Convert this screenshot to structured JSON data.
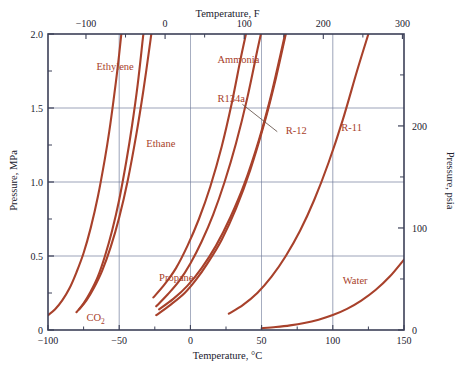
{
  "chart_data": {
    "type": "line",
    "title": "",
    "xlabel": "Temperature, °C",
    "xlabel_top": "Temperature, F",
    "ylabel": "Pressure, MPa",
    "ylabel_right": "Pressure, psia",
    "xlim": [
      -100,
      150
    ],
    "ylim": [
      0,
      2.0
    ],
    "xlim_top_F": [
      -148,
      302
    ],
    "ylim_right_psia": [
      0,
      290.1
    ],
    "grid": true,
    "legend_position": "inline-annotations",
    "xticks_bottom": [
      {
        "value": -100,
        "label": "−100"
      },
      {
        "value": -50,
        "label": "−50"
      },
      {
        "value": 0,
        "label": "0"
      },
      {
        "value": 50,
        "label": "50"
      },
      {
        "value": 100,
        "label": "100"
      },
      {
        "value": 150,
        "label": "150"
      }
    ],
    "xticks_top_F": [
      {
        "value": -100,
        "label": "−100"
      },
      {
        "value": 0,
        "label": "0"
      },
      {
        "value": 100,
        "label": "100"
      },
      {
        "value": 200,
        "label": "200"
      },
      {
        "value": 300,
        "label": "300"
      }
    ],
    "yticks_left": [
      {
        "value": 0,
        "label": "0",
        "major": true
      },
      {
        "value": 0.25,
        "label": "",
        "major": false
      },
      {
        "value": 0.5,
        "label": "0.5",
        "major": true
      },
      {
        "value": 0.75,
        "label": "",
        "major": false
      },
      {
        "value": 1.0,
        "label": "1.0",
        "major": true
      },
      {
        "value": 1.25,
        "label": "",
        "major": false
      },
      {
        "value": 1.5,
        "label": "1.5",
        "major": true
      },
      {
        "value": 1.75,
        "label": "",
        "major": false
      },
      {
        "value": 2.0,
        "label": "2.0",
        "major": true
      }
    ],
    "yticks_right_psia": [
      {
        "value": 0,
        "label": "0",
        "major": true
      },
      {
        "value": 50,
        "label": "",
        "major": false
      },
      {
        "value": 100,
        "label": "100",
        "major": true
      },
      {
        "value": 150,
        "label": "",
        "major": false
      },
      {
        "value": 200,
        "label": "200",
        "major": true
      },
      {
        "value": 250,
        "label": "",
        "major": false
      },
      {
        "value": 300,
        "label": "300",
        "major": true
      }
    ],
    "curve_color": "#A8412B",
    "frame_color": "#3c4058",
    "grid_color": "#6e7a99",
    "series": [
      {
        "name": "CO2",
        "label": "CO₂",
        "points": [
          [
            -100,
            0.1
          ],
          [
            -95,
            0.14
          ],
          [
            -90,
            0.2
          ],
          [
            -85,
            0.28
          ],
          [
            -80,
            0.39
          ],
          [
            -75,
            0.52
          ],
          [
            -70,
            0.69
          ],
          [
            -65,
            0.9
          ],
          [
            -60,
            1.16
          ],
          [
            -57,
            1.34
          ],
          [
            -54,
            1.55
          ],
          [
            -51,
            1.78
          ],
          [
            -48.5,
            2.0
          ]
        ]
      },
      {
        "name": "Ethylene",
        "label": "Ethylene",
        "points": [
          [
            -80,
            0.12
          ],
          [
            -75,
            0.18
          ],
          [
            -70,
            0.26
          ],
          [
            -65,
            0.36
          ],
          [
            -60,
            0.5
          ],
          [
            -55,
            0.67
          ],
          [
            -50,
            0.88
          ],
          [
            -45,
            1.14
          ],
          [
            -41,
            1.38
          ],
          [
            -37,
            1.66
          ],
          [
            -33.5,
            1.96
          ],
          [
            -33,
            2.0
          ]
        ]
      },
      {
        "name": "Ethane",
        "label": "Ethane",
        "points": [
          [
            -78,
            0.14
          ],
          [
            -73,
            0.2
          ],
          [
            -68,
            0.28
          ],
          [
            -62,
            0.4
          ],
          [
            -56,
            0.56
          ],
          [
            -50,
            0.76
          ],
          [
            -44,
            1.01
          ],
          [
            -38,
            1.32
          ],
          [
            -33,
            1.62
          ],
          [
            -28,
            1.96
          ],
          [
            -27.5,
            2.0
          ]
        ]
      },
      {
        "name": "Propane",
        "label": "Propane",
        "points": [
          [
            -26,
            0.22
          ],
          [
            -18,
            0.31
          ],
          [
            -10,
            0.42
          ],
          [
            -2,
            0.57
          ],
          [
            6,
            0.75
          ],
          [
            14,
            0.97
          ],
          [
            22,
            1.24
          ],
          [
            29,
            1.53
          ],
          [
            35,
            1.82
          ],
          [
            39,
            2.0
          ]
        ]
      },
      {
        "name": "Ammonia",
        "label": "Ammonia",
        "points": [
          [
            -24,
            0.16
          ],
          [
            -16,
            0.24
          ],
          [
            -8,
            0.33
          ],
          [
            0,
            0.45
          ],
          [
            8,
            0.6
          ],
          [
            16,
            0.78
          ],
          [
            24,
            1.0
          ],
          [
            32,
            1.26
          ],
          [
            40,
            1.57
          ],
          [
            47,
            1.89
          ],
          [
            49.5,
            2.0
          ]
        ]
      },
      {
        "name": "R134a",
        "label": "R134a",
        "points": [
          [
            -24,
            0.1
          ],
          [
            -14,
            0.17
          ],
          [
            -4,
            0.25
          ],
          [
            4,
            0.34
          ],
          [
            12,
            0.45
          ],
          [
            22,
            0.61
          ],
          [
            32,
            0.82
          ],
          [
            42,
            1.08
          ],
          [
            52,
            1.4
          ],
          [
            60,
            1.7
          ],
          [
            67,
            2.0
          ]
        ]
      },
      {
        "name": "R-12",
        "label": "R-12",
        "points": [
          [
            -22,
            0.14
          ],
          [
            -12,
            0.21
          ],
          [
            -2,
            0.3
          ],
          [
            8,
            0.42
          ],
          [
            18,
            0.57
          ],
          [
            28,
            0.76
          ],
          [
            38,
            0.99
          ],
          [
            48,
            1.28
          ],
          [
            56,
            1.56
          ],
          [
            63,
            1.85
          ],
          [
            66.5,
            2.0
          ]
        ]
      },
      {
        "name": "R-11",
        "label": "R-11",
        "points": [
          [
            27,
            0.11
          ],
          [
            37,
            0.17
          ],
          [
            47,
            0.25
          ],
          [
            57,
            0.36
          ],
          [
            67,
            0.5
          ],
          [
            77,
            0.67
          ],
          [
            87,
            0.88
          ],
          [
            97,
            1.13
          ],
          [
            107,
            1.42
          ],
          [
            117,
            1.75
          ],
          [
            125,
            2.0
          ]
        ]
      },
      {
        "name": "Water",
        "label": "Water",
        "points": [
          [
            50,
            0.012
          ],
          [
            60,
            0.02
          ],
          [
            70,
            0.031
          ],
          [
            80,
            0.047
          ],
          [
            90,
            0.07
          ],
          [
            100,
            0.101
          ],
          [
            110,
            0.143
          ],
          [
            120,
            0.199
          ],
          [
            130,
            0.27
          ],
          [
            140,
            0.361
          ],
          [
            150,
            0.476
          ]
        ]
      }
    ],
    "annotations": [
      {
        "name": "ethylene-label",
        "text": "Ethylene",
        "x": -66,
        "y": 1.77,
        "leader": null
      },
      {
        "name": "ethane-label",
        "text": "Ethane",
        "x": -31,
        "y": 1.25,
        "leader": null
      },
      {
        "name": "co2-label",
        "text": "CO₂",
        "x": -73,
        "y": 0.075,
        "leader": null
      },
      {
        "name": "propane-label",
        "text": "Propane",
        "x": -22,
        "y": 0.345,
        "leader": null
      },
      {
        "name": "ammonia-label",
        "text": "Ammonia",
        "x": 19,
        "y": 1.815,
        "leader": null
      },
      {
        "name": "r134a-label",
        "text": "R134a",
        "x": 19,
        "y": 1.555,
        "leader": {
          "x1": 36.5,
          "y1": 1.525,
          "x2": 61,
          "y2": 1.34
        }
      },
      {
        "name": "r12-label",
        "text": "R-12",
        "x": 67,
        "y": 1.335,
        "leader": null
      },
      {
        "name": "r11-label",
        "text": "R-11",
        "x": 106,
        "y": 1.355,
        "leader": null
      },
      {
        "name": "water-label",
        "text": "Water",
        "x": 107,
        "y": 0.325,
        "leader": null
      }
    ]
  }
}
